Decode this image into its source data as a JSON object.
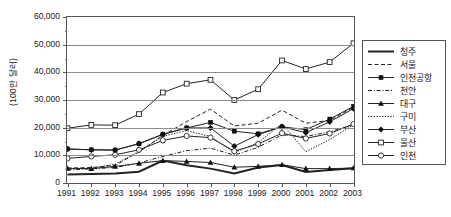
{
  "chart_data": {
    "type": "line",
    "title": "",
    "xlabel": "",
    "ylabel": "(100만 달러)",
    "x": [
      1991,
      1992,
      1993,
      1994,
      1995,
      1996,
      1997,
      1998,
      1999,
      2000,
      2001,
      2002,
      2003
    ],
    "xtick_labels": [
      "1991",
      "1992",
      "1993",
      "1994",
      "1995",
      "1996",
      "1997",
      "1998",
      "1999",
      "2000",
      "2001",
      "2002",
      "2003"
    ],
    "ytick_labels": [
      "60,000",
      "50,000",
      "40,000",
      "30,000",
      "20,000",
      "10,000",
      "0"
    ],
    "ytick_values": [
      60000,
      50000,
      40000,
      30000,
      20000,
      10000,
      0
    ],
    "ylim": [
      0,
      60000
    ],
    "ymajor_step": 10000,
    "yminor_step": 5000,
    "grid": "horizontal",
    "legend_position": "right",
    "series": [
      {
        "name": "청주",
        "style": "solid-thick",
        "marker": "none",
        "values": [
          3100,
          3250,
          3400,
          4100,
          8100,
          6400,
          5200,
          3400,
          5600,
          6500,
          4000,
          4700,
          5300
        ]
      },
      {
        "name": "서울",
        "style": "dashed",
        "marker": "none",
        "values": [
          5400,
          5600,
          6400,
          11200,
          17200,
          22200,
          26700,
          20600,
          21600,
          26300,
          21600,
          22600,
          27400
        ]
      },
      {
        "name": "인천공항",
        "style": "solid",
        "marker": "filled-square",
        "values": [
          12300,
          12000,
          11900,
          14200,
          17600,
          19900,
          21900,
          18700,
          17800,
          20300,
          19300,
          23100,
          27700
        ]
      },
      {
        "name": "천안",
        "style": "dash-dot",
        "marker": "none",
        "values": [
          4700,
          5100,
          5600,
          7200,
          9600,
          11700,
          12600,
          10100,
          12900,
          17400,
          16800,
          18500,
          21100
        ]
      },
      {
        "name": "대구",
        "style": "solid",
        "marker": "filled-triangle",
        "values": [
          5300,
          5200,
          6000,
          7100,
          8100,
          7800,
          7400,
          5700,
          6000,
          6600,
          5200,
          5200,
          5400
        ]
      },
      {
        "name": "구미",
        "style": "dotted",
        "marker": "none",
        "values": [
          5000,
          5300,
          6800,
          11400,
          16900,
          18900,
          16800,
          11000,
          14600,
          21500,
          11300,
          15700,
          21100
        ]
      },
      {
        "name": "부산",
        "style": "solid",
        "marker": "filled-diamond",
        "values": [
          12300,
          12000,
          11900,
          14200,
          17600,
          19900,
          19900,
          13300,
          17500,
          20300,
          18200,
          22100,
          26900
        ]
      },
      {
        "name": "울산",
        "style": "solid",
        "marker": "open-square",
        "values": [
          19800,
          21000,
          20900,
          24900,
          32700,
          35900,
          37300,
          30000,
          33900,
          44300,
          41200,
          43700,
          50500
        ]
      },
      {
        "name": "인천",
        "style": "solid",
        "marker": "open-circle",
        "values": [
          8900,
          9600,
          10200,
          12000,
          15400,
          17000,
          16400,
          11500,
          14100,
          18000,
          16100,
          17900,
          21300
        ]
      }
    ]
  }
}
